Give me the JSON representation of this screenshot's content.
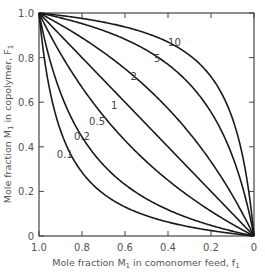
{
  "chart_data": {
    "type": "line",
    "title": "",
    "xlabel": "Mole fraction M1 in comonomer feed, f1",
    "ylabel": "Mole fraction M1 in copolymer, F1",
    "xlim": [
      1.0,
      0
    ],
    "ylim": [
      0,
      1.0
    ],
    "x_reversed": true,
    "grid": false,
    "legend": "inline curve labels",
    "x_ticks": [
      "1.0",
      "0.8",
      "0.6",
      "0.4",
      "0.2",
      "0"
    ],
    "y_ticks": [
      "0",
      "0.2",
      "0.4",
      "0.6",
      "0.8",
      "1.0"
    ],
    "model": "F1 = r1*f1 / (r1*f1 + (1 - f1))",
    "x": [
      0,
      0.1,
      0.2,
      0.3,
      0.4,
      0.5,
      0.6,
      0.7,
      0.8,
      0.9,
      1.0
    ],
    "series": [
      {
        "name": "0.1",
        "r1": 0.1,
        "values": [
          0,
          0.011,
          0.024,
          0.041,
          0.063,
          0.091,
          0.13,
          0.189,
          0.286,
          0.474,
          1.0
        ]
      },
      {
        "name": "0.2",
        "r1": 0.2,
        "values": [
          0,
          0.022,
          0.048,
          0.079,
          0.118,
          0.167,
          0.231,
          0.318,
          0.444,
          0.643,
          1.0
        ]
      },
      {
        "name": "0.5",
        "r1": 0.5,
        "values": [
          0,
          0.053,
          0.111,
          0.176,
          0.25,
          0.333,
          0.429,
          0.538,
          0.667,
          0.818,
          1.0
        ]
      },
      {
        "name": "1",
        "r1": 1,
        "values": [
          0,
          0.1,
          0.2,
          0.3,
          0.4,
          0.5,
          0.6,
          0.7,
          0.8,
          0.9,
          1.0
        ]
      },
      {
        "name": "2",
        "r1": 2,
        "values": [
          0,
          0.182,
          0.333,
          0.462,
          0.571,
          0.667,
          0.75,
          0.824,
          0.889,
          0.947,
          1.0
        ]
      },
      {
        "name": "5",
        "r1": 5,
        "values": [
          0,
          0.357,
          0.556,
          0.682,
          0.769,
          0.833,
          0.882,
          0.921,
          0.952,
          0.978,
          1.0
        ]
      },
      {
        "name": "10",
        "r1": 10,
        "values": [
          0,
          0.526,
          0.714,
          0.811,
          0.87,
          0.909,
          0.938,
          0.959,
          0.976,
          0.989,
          1.0
        ]
      }
    ],
    "curve_labels": [
      {
        "text": "10",
        "f1": 0.37,
        "F1": 0.85
      },
      {
        "text": "5",
        "f1": 0.45,
        "F1": 0.78
      },
      {
        "text": "2",
        "f1": 0.56,
        "F1": 0.7
      },
      {
        "text": "1",
        "f1": 0.65,
        "F1": 0.57
      },
      {
        "text": "0.5",
        "f1": 0.73,
        "F1": 0.5
      },
      {
        "text": "0.2",
        "f1": 0.8,
        "F1": 0.43
      },
      {
        "text": "0.1",
        "f1": 0.88,
        "F1": 0.35
      }
    ]
  },
  "axes": {
    "x_title_main": "Mole fraction M",
    "x_title_sub": "1",
    "x_title_rest": " in comonomer feed, f",
    "x_title_sub2": "1",
    "y_title_main": "Mole fraction M",
    "y_title_sub": "1",
    "y_title_rest": " in copolymer, F",
    "y_title_sub2": "1"
  },
  "colors": {
    "line": "#1a1a1a",
    "axis": "#444444",
    "text": "#555555"
  }
}
